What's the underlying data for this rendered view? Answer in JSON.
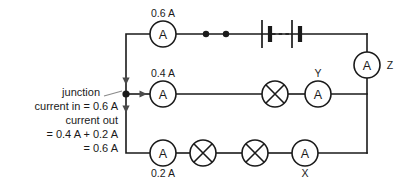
{
  "diagram": {
    "colors": {
      "wire": "#1a1a1a",
      "background": "#ffffff",
      "arrow": "#4a4a4a",
      "leader": "#8a8a8a"
    },
    "meter_glyph": "A",
    "branches": {
      "top": {
        "ammeter_reading": "0.6 A",
        "meter_glyph": "A",
        "terminals": 2
      },
      "middle": {
        "ammeter_reading": "0.4 A",
        "meter_glyph": "A",
        "lamp_count": 1,
        "second_meter_id": "Y"
      },
      "bottom": {
        "ammeter_reading": "0.2 A",
        "meter_glyph": "A",
        "lamp_count": 2,
        "second_meter_id": "X"
      },
      "right": {
        "meter_id": "Z",
        "meter_glyph": "A"
      }
    },
    "annotation": {
      "lines": [
        "junction",
        "current in = 0.6 A",
        "current out",
        "= 0.4 A + 0.2 A",
        "= 0.6 A"
      ]
    }
  }
}
